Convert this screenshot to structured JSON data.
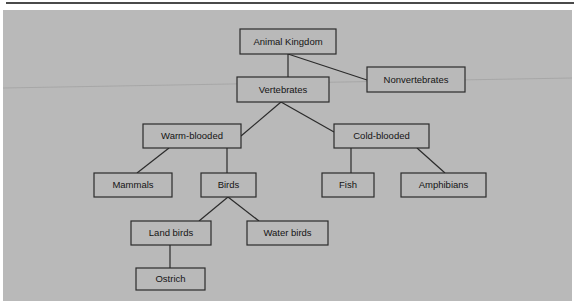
{
  "page": {
    "background_color": "#b9b9b9",
    "paper_color": "#b9b9b9",
    "rule_color": "#4a4a4a",
    "line_color": "#2b2b2b",
    "text_color": "#141414"
  },
  "diagram": {
    "type": "tree",
    "nodes": [
      {
        "id": "animal-kingdom",
        "label": "Animal Kingdom",
        "x": 237,
        "y": 19,
        "w": 96,
        "h": 25
      },
      {
        "id": "nonvertebrates",
        "label": "Nonvertebrates",
        "x": 364,
        "y": 57,
        "w": 98,
        "h": 25
      },
      {
        "id": "vertebrates",
        "label": "Vertebrates",
        "x": 234,
        "y": 67,
        "w": 92,
        "h": 25
      },
      {
        "id": "warm-blooded",
        "label": "Warm-blooded",
        "x": 140,
        "y": 114,
        "w": 98,
        "h": 24
      },
      {
        "id": "cold-blooded",
        "label": "Cold-blooded",
        "x": 331,
        "y": 114,
        "w": 95,
        "h": 24
      },
      {
        "id": "mammals",
        "label": "Mammals",
        "x": 91,
        "y": 163,
        "w": 78,
        "h": 24
      },
      {
        "id": "birds",
        "label": "Birds",
        "x": 198,
        "y": 163,
        "w": 55,
        "h": 24
      },
      {
        "id": "fish",
        "label": "Fish",
        "x": 319,
        "y": 163,
        "w": 52,
        "h": 24
      },
      {
        "id": "amphibians",
        "label": "Amphibians",
        "x": 398,
        "y": 163,
        "w": 85,
        "h": 24
      },
      {
        "id": "land-birds",
        "label": "Land birds",
        "x": 128,
        "y": 211,
        "w": 80,
        "h": 24
      },
      {
        "id": "water-birds",
        "label": "Water birds",
        "x": 244,
        "y": 211,
        "w": 81,
        "h": 24
      },
      {
        "id": "ostrich",
        "label": "Ostrich",
        "x": 133,
        "y": 258,
        "w": 69,
        "h": 22
      }
    ],
    "edges": [
      {
        "id": "edge-animalkingdom-vertebrates",
        "from": "animal-kingdom",
        "to": "vertebrates",
        "x1": 285,
        "y1": 44,
        "x2": 285,
        "y2": 67
      },
      {
        "id": "edge-animalkingdom-nonvertebrates",
        "from": "animal-kingdom",
        "to": "nonvertebrates",
        "x1": 285,
        "y1": 44,
        "x2": 364,
        "y2": 70
      },
      {
        "id": "edge-vertebrates-warmblooded",
        "from": "vertebrates",
        "to": "warm-blooded",
        "x1": 278,
        "y1": 92,
        "x2": 238,
        "y2": 126
      },
      {
        "id": "edge-vertebrates-coldblooded",
        "from": "vertebrates",
        "to": "cold-blooded",
        "x1": 278,
        "y1": 92,
        "x2": 331,
        "y2": 122
      },
      {
        "id": "edge-warmblooded-mammals",
        "from": "warm-blooded",
        "to": "mammals",
        "x1": 166,
        "y1": 138,
        "x2": 134,
        "y2": 163
      },
      {
        "id": "edge-warmblooded-birds",
        "from": "warm-blooded",
        "to": "birds",
        "x1": 224,
        "y1": 138,
        "x2": 224,
        "y2": 163
      },
      {
        "id": "edge-coldblooded-fish",
        "from": "cold-blooded",
        "to": "fish",
        "x1": 348,
        "y1": 138,
        "x2": 348,
        "y2": 163
      },
      {
        "id": "edge-coldblooded-amphibians",
        "from": "cold-blooded",
        "to": "amphibians",
        "x1": 414,
        "y1": 138,
        "x2": 442,
        "y2": 163
      },
      {
        "id": "edge-birds-landbirds",
        "from": "birds",
        "to": "land-birds",
        "x1": 225,
        "y1": 187,
        "x2": 196,
        "y2": 211
      },
      {
        "id": "edge-birds-waterbirds",
        "from": "birds",
        "to": "water-birds",
        "x1": 225,
        "y1": 187,
        "x2": 256,
        "y2": 211
      },
      {
        "id": "edge-landbirds-ostrich",
        "from": "land-birds",
        "to": "ostrich",
        "x1": 167,
        "y1": 235,
        "x2": 167,
        "y2": 258
      }
    ],
    "artifacts": {
      "crease": {
        "x1": 0,
        "y1": 78,
        "x2": 569,
        "y2": 68
      }
    }
  }
}
